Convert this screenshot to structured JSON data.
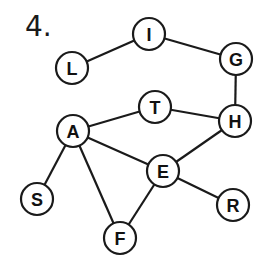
{
  "problem_number": "4.",
  "graph": {
    "node_radius": 16,
    "nodes": [
      {
        "id": "L",
        "label": "L",
        "x": 72,
        "y": 68
      },
      {
        "id": "I",
        "label": "I",
        "x": 149,
        "y": 34
      },
      {
        "id": "G",
        "label": "G",
        "x": 236,
        "y": 59
      },
      {
        "id": "H",
        "label": "H",
        "x": 235,
        "y": 121
      },
      {
        "id": "T",
        "label": "T",
        "x": 155,
        "y": 107
      },
      {
        "id": "A",
        "label": "A",
        "x": 73,
        "y": 131
      },
      {
        "id": "E",
        "label": "E",
        "x": 163,
        "y": 171
      },
      {
        "id": "S",
        "label": "S",
        "x": 37,
        "y": 199
      },
      {
        "id": "R",
        "label": "R",
        "x": 233,
        "y": 205
      },
      {
        "id": "F",
        "label": "F",
        "x": 120,
        "y": 238
      }
    ],
    "edges": [
      [
        "L",
        "I"
      ],
      [
        "I",
        "G"
      ],
      [
        "G",
        "H"
      ],
      [
        "T",
        "H"
      ],
      [
        "A",
        "T"
      ],
      [
        "A",
        "E"
      ],
      [
        "H",
        "E"
      ],
      [
        "A",
        "S"
      ],
      [
        "A",
        "F"
      ],
      [
        "E",
        "F"
      ],
      [
        "E",
        "R"
      ]
    ]
  }
}
